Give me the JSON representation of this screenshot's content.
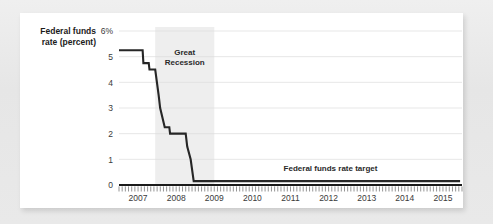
{
  "chart_data": {
    "type": "line",
    "title_line1": "Federal funds",
    "title_line2": "rate (percent)",
    "xlabel": "",
    "ylabel": "Federal funds rate (percent)",
    "ylim": [
      0,
      6
    ],
    "xlim": [
      2007,
      2016
    ],
    "grid": true,
    "legend_position": "none",
    "ytick_labels": [
      "6%",
      "5",
      "4",
      "3",
      "2",
      "1",
      "0"
    ],
    "ytick_values": [
      6,
      5,
      4,
      3,
      2,
      1,
      0
    ],
    "xtick_labels": [
      "2007",
      "2008",
      "2009",
      "2010",
      "2011",
      "2012",
      "2013",
      "2014",
      "2015"
    ],
    "xtick_values": [
      2007,
      2008,
      2009,
      2010,
      2011,
      2012,
      2013,
      2014,
      2015
    ],
    "minor_tick_interval_months": 1,
    "annotations": [
      {
        "name": "great-recession",
        "text_line1": "Great",
        "text_line2": "Recession",
        "x_start": 2007.95,
        "x_end": 2009.5
      },
      {
        "name": "federal-funds-rate-target",
        "text": "Federal funds rate target",
        "x": 2012.55,
        "y": 0.55
      }
    ],
    "shaded_regions": [
      {
        "label": "Great Recession",
        "x_start": 2007.95,
        "x_end": 2009.5,
        "color": "#eeeeee"
      }
    ],
    "series": [
      {
        "name": "Federal funds rate target",
        "color": "#262626",
        "points": [
          {
            "x": 2007.0,
            "y": 5.25
          },
          {
            "x": 2007.62,
            "y": 5.25
          },
          {
            "x": 2007.64,
            "y": 4.75
          },
          {
            "x": 2007.78,
            "y": 4.75
          },
          {
            "x": 2007.8,
            "y": 4.5
          },
          {
            "x": 2007.95,
            "y": 4.5
          },
          {
            "x": 2008.04,
            "y": 3.5
          },
          {
            "x": 2008.08,
            "y": 3.0
          },
          {
            "x": 2008.2,
            "y": 2.25
          },
          {
            "x": 2008.32,
            "y": 2.25
          },
          {
            "x": 2008.34,
            "y": 2.0
          },
          {
            "x": 2008.75,
            "y": 2.0
          },
          {
            "x": 2008.79,
            "y": 1.5
          },
          {
            "x": 2008.88,
            "y": 1.0
          },
          {
            "x": 2008.96,
            "y": 0.15
          },
          {
            "x": 2015.95,
            "y": 0.15
          }
        ]
      }
    ]
  }
}
